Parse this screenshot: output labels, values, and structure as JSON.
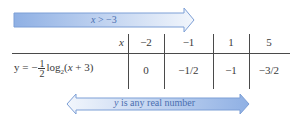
{
  "domain_arrow": {
    "label_var": "x",
    "label_rest": " > −3",
    "direction": "right",
    "color_dark": "#8fb0e4",
    "color_light": "#e6eefa"
  },
  "table": {
    "header_label": "x",
    "x_values": [
      "−2",
      "−1",
      "1",
      "5"
    ],
    "row_label": {
      "prefix": "y = −",
      "frac_num": "1",
      "frac_den": "2",
      "log": "log",
      "base": "2",
      "arg_open": "(",
      "arg_var": "x",
      "arg_rest": " + 3)"
    },
    "y_values": [
      "0",
      "−1/2",
      "−1",
      "−3/2"
    ]
  },
  "range_arrow": {
    "label_var": "y",
    "label_rest": " is any real number",
    "direction": "both",
    "color_dark": "#8fb0e4",
    "color_light": "#e6eefa"
  }
}
